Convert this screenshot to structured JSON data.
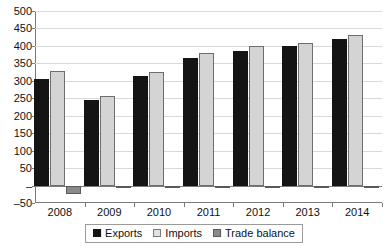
{
  "chart_data": {
    "type": "bar",
    "title": "",
    "subtitle": "",
    "xlabel": "",
    "ylabel": "",
    "categories": [
      "2008",
      "2009",
      "2010",
      "2011",
      "2012",
      "2013",
      "2014"
    ],
    "series": [
      {
        "name": "Exports",
        "color": "#141414",
        "values": [
          306,
          244,
          313,
          366,
          386,
          400,
          419
        ]
      },
      {
        "name": "Imports",
        "color": "#d4d4d4",
        "values": [
          329,
          257,
          324,
          379,
          400,
          409,
          432
        ]
      },
      {
        "name": "Trade balance",
        "color": "#8a8a8a",
        "values": [
          -23,
          -3,
          -2,
          -2,
          -1,
          -1,
          -1
        ]
      }
    ],
    "ylim": [
      -50,
      500
    ],
    "ytick_values": [
      500,
      450,
      400,
      350,
      300,
      250,
      200,
      150,
      100,
      50,
      0,
      -50
    ],
    "ytick_labels": [
      "500",
      "450",
      "400",
      "350",
      "300",
      "250",
      "200",
      "150",
      "100",
      "50",
      "–",
      "–50"
    ],
    "grid": true,
    "grid_axis": "y",
    "legend_position": "bottom",
    "legend_entries": [
      "Exports",
      "Imports",
      "Trade balance"
    ],
    "annotations": []
  },
  "colors": {
    "axis": "#7a7a7a",
    "gridline": "#d9d9d9",
    "zero_line": "#7a7a7a",
    "text": "#111111",
    "background": "#ffffff"
  }
}
